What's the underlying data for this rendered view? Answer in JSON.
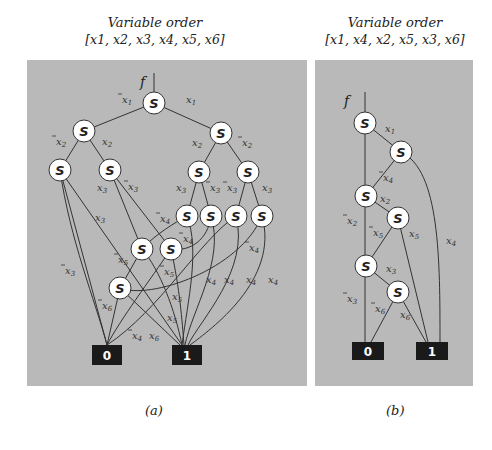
{
  "panels": [
    {
      "id": "a",
      "title": "Variable order",
      "order": "[x1, x2, x3, x4, x5, x6]",
      "caption": "(a)",
      "rect": [
        27,
        60,
        280,
        326
      ],
      "f_label": {
        "text": "f",
        "x": 140,
        "y": 87
      },
      "root_line": [
        154,
        73,
        154,
        92
      ],
      "nodes": [
        {
          "id": "n1",
          "x": 154,
          "y": 103
        },
        {
          "id": "n2",
          "x": 84,
          "y": 131
        },
        {
          "id": "n3",
          "x": 221,
          "y": 133
        },
        {
          "id": "n4",
          "x": 60,
          "y": 170
        },
        {
          "id": "n5",
          "x": 110,
          "y": 170
        },
        {
          "id": "n6",
          "x": 199,
          "y": 172
        },
        {
          "id": "n7",
          "x": 248,
          "y": 172
        },
        {
          "id": "n8",
          "x": 187,
          "y": 216
        },
        {
          "id": "n9",
          "x": 211,
          "y": 216
        },
        {
          "id": "n10",
          "x": 236,
          "y": 216
        },
        {
          "id": "n11",
          "x": 262,
          "y": 216
        },
        {
          "id": "n12",
          "x": 142,
          "y": 249
        },
        {
          "id": "n13",
          "x": 171,
          "y": 249
        },
        {
          "id": "n14",
          "x": 120,
          "y": 288
        }
      ],
      "terminals": [
        {
          "id": "t0",
          "label": "0",
          "x": 92,
          "y": 345,
          "w": 30,
          "h": 20
        },
        {
          "id": "t1",
          "label": "1",
          "x": 172,
          "y": 345,
          "w": 30,
          "h": 20
        }
      ],
      "edges": [
        "M154,103 L84,131",
        "M154,103 L221,133",
        "M84,131 L60,170",
        "M84,131 L110,170",
        "M221,133 L199,172",
        "M221,133 L248,172",
        "M60,170 L107,345",
        "M60,170 L182,345",
        "M110,170 L142,249",
        "M110,170 L171,249",
        "M199,172 L187,216",
        "M199,172 L211,216",
        "M248,172 L236,216",
        "M248,172 L262,216",
        "M187,216 C165,228 150,240 142,249",
        "M187,216 C200,250 188,300 182,345",
        "M211,216 C208,240 190,252 171,249",
        "M211,216 C225,260 192,310 185,345",
        "M236,216 C200,240 160,310 107,345",
        "M236,216 C250,270 200,320 188,345",
        "M262,216 C240,270 150,300 120,288",
        "M262,216 C280,280 210,330 190,345",
        "M142,249 L120,288",
        "M142,249 C160,270 175,310 182,345",
        "M171,249 C150,280 120,320 107,345",
        "M171,249 C180,290 182,320 184,345",
        "M120,288 L107,345",
        "M120,288 L180,345",
        "M60,170 C70,240 95,300 107,345"
      ],
      "edge_labels": [
        {
          "t": "x1",
          "bar": true,
          "x": 122,
          "y": 103
        },
        {
          "t": "x1",
          "bar": false,
          "x": 186,
          "y": 103
        },
        {
          "t": "x2",
          "bar": true,
          "x": 56,
          "y": 145
        },
        {
          "t": "x2",
          "bar": false,
          "x": 102,
          "y": 145
        },
        {
          "t": "x2",
          "bar": false,
          "x": 192,
          "y": 146
        },
        {
          "t": "x2",
          "bar": true,
          "x": 242,
          "y": 146
        },
        {
          "t": "x3",
          "bar": false,
          "x": 97,
          "y": 191
        },
        {
          "t": "x3",
          "bar": true,
          "x": 128,
          "y": 190
        },
        {
          "t": "x3",
          "bar": false,
          "x": 176,
          "y": 191
        },
        {
          "t": "x3",
          "bar": true,
          "x": 210,
          "y": 191
        },
        {
          "t": "x3",
          "bar": true,
          "x": 227,
          "y": 191
        },
        {
          "t": "x3",
          "bar": false,
          "x": 262,
          "y": 191
        },
        {
          "t": "x3",
          "bar": false,
          "x": 95,
          "y": 221
        },
        {
          "t": "x4",
          "bar": true,
          "x": 160,
          "y": 222
        },
        {
          "t": "x4",
          "bar": true,
          "x": 183,
          "y": 242
        },
        {
          "t": "x4",
          "bar": true,
          "x": 249,
          "y": 251
        },
        {
          "t": "x3",
          "bar": true,
          "x": 65,
          "y": 274
        },
        {
          "t": "x5",
          "bar": true,
          "x": 118,
          "y": 263
        },
        {
          "t": "x5",
          "bar": true,
          "x": 164,
          "y": 275
        },
        {
          "t": "x4",
          "bar": false,
          "x": 206,
          "y": 283
        },
        {
          "t": "x4",
          "bar": false,
          "x": 224,
          "y": 283
        },
        {
          "t": "x4",
          "bar": false,
          "x": 246,
          "y": 283
        },
        {
          "t": "x4",
          "bar": false,
          "x": 268,
          "y": 283
        },
        {
          "t": "x5",
          "bar": false,
          "x": 172,
          "y": 300
        },
        {
          "t": "x6",
          "bar": true,
          "x": 102,
          "y": 309
        },
        {
          "t": "x5",
          "bar": false,
          "x": 167,
          "y": 321
        },
        {
          "t": "x4",
          "bar": true,
          "x": 132,
          "y": 339
        },
        {
          "t": "x6",
          "bar": false,
          "x": 149,
          "y": 339
        }
      ]
    },
    {
      "id": "b",
      "title": "Variable order",
      "order": "[x1, x4, x2, x5, x3, x6]",
      "caption": "(b)",
      "rect": [
        315,
        60,
        158,
        326
      ],
      "f_label": {
        "text": "f",
        "x": 344,
        "y": 106
      },
      "root_line": [
        365,
        92,
        365,
        112
      ],
      "nodes": [
        {
          "id": "m1",
          "x": 365,
          "y": 123
        },
        {
          "id": "m2",
          "x": 401,
          "y": 152
        },
        {
          "id": "m3",
          "x": 366,
          "y": 196
        },
        {
          "id": "m4",
          "x": 398,
          "y": 218
        },
        {
          "id": "m5",
          "x": 366,
          "y": 266
        },
        {
          "id": "m6",
          "x": 398,
          "y": 292
        }
      ],
      "terminals": [
        {
          "id": "u0",
          "label": "0",
          "x": 352,
          "y": 342,
          "w": 32,
          "h": 18
        },
        {
          "id": "u1",
          "label": "1",
          "x": 416,
          "y": 342,
          "w": 32,
          "h": 18
        }
      ],
      "edges": [
        "M365,123 L365,342",
        "M365,123 L401,152",
        "M401,152 L366,196",
        "M401,152 C440,170 440,260 440,342",
        "M366,196 L398,218",
        "M398,218 L366,266",
        "M398,218 L428,342",
        "M366,266 L398,292",
        "M398,292 L371,342",
        "M398,292 L426,342"
      ],
      "edge_labels": [
        {
          "t": "x1",
          "bar": false,
          "x": 385,
          "y": 132
        },
        {
          "t": "x4",
          "bar": true,
          "x": 383,
          "y": 181
        },
        {
          "t": "x2",
          "bar": false,
          "x": 380,
          "y": 202
        },
        {
          "t": "x2",
          "bar": true,
          "x": 347,
          "y": 224
        },
        {
          "t": "x5",
          "bar": true,
          "x": 373,
          "y": 236
        },
        {
          "t": "x5",
          "bar": false,
          "x": 409,
          "y": 237
        },
        {
          "t": "x4",
          "bar": false,
          "x": 446,
          "y": 244
        },
        {
          "t": "x3",
          "bar": false,
          "x": 386,
          "y": 272
        },
        {
          "t": "x3",
          "bar": true,
          "x": 347,
          "y": 302
        },
        {
          "t": "x6",
          "bar": true,
          "x": 375,
          "y": 312
        },
        {
          "t": "x6",
          "bar": false,
          "x": 400,
          "y": 318
        }
      ]
    }
  ],
  "node_label": "S"
}
